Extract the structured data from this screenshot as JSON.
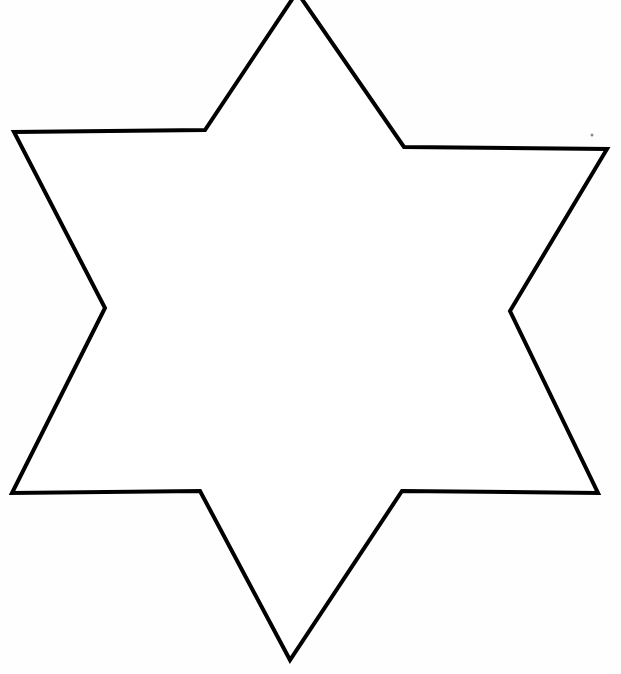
{
  "figure": {
    "background_color": "#ffffff",
    "stroke_color": "#000000",
    "fill_color": "#ffffff",
    "stroke_width": 4,
    "vertices": [
      [
        297,
        -8
      ],
      [
        404,
        147
      ],
      [
        607,
        149
      ],
      [
        510,
        311
      ],
      [
        598,
        493
      ],
      [
        402,
        491
      ],
      [
        290,
        660
      ],
      [
        200,
        491
      ],
      [
        12,
        493
      ],
      [
        105,
        308
      ],
      [
        14,
        132
      ],
      [
        205,
        130
      ]
    ]
  }
}
